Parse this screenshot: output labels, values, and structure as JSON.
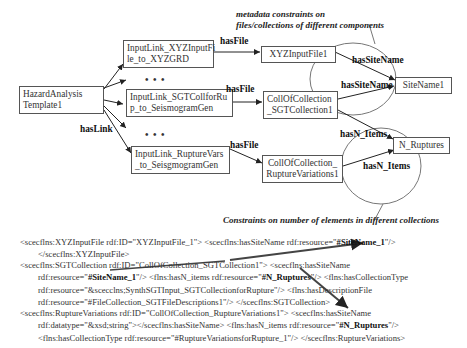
{
  "notes": {
    "metadata_line1": "metadata constraints on",
    "metadata_line2": "files/collections of different components",
    "constraints": "Constraints on number of elements in different collections"
  },
  "nodes": {
    "template": {
      "line1": "HazardAnalysis",
      "line2": "Template1"
    },
    "link_xyz": {
      "line1": "InputLink_XYZInputFi",
      "line2": "le_to_XYZGRD"
    },
    "link_sgt": {
      "line1": "InputLink_SGTCollforRu",
      "line2": "p_to_SeismogramGen"
    },
    "link_rupture": {
      "line1": "InputLink_RuptureVars",
      "line2": "_to_SeisgmogramGen"
    },
    "xyz_file": {
      "line1": "XYZInputFile1"
    },
    "sgt_coll": {
      "line1": "CollOfCollection",
      "line2": "_SGTCollection1"
    },
    "rupture_coll": {
      "line1": "CollOfCollection_",
      "line2": "RuptureVariations1"
    },
    "sitename": {
      "line1": "SiteName1"
    },
    "n_ruptures": {
      "line1": "N_Ruptures"
    }
  },
  "edges": {
    "has_link": "hasLink",
    "has_file_1": "hasFile",
    "has_file_2": "hasFile",
    "has_file_3": "hasFile",
    "has_sitename_1": "hasSiteName",
    "has_sitename_2": "hasSiteName",
    "has_n_items_1": "hasN_Items",
    "has_n_items_2": "hasN_Items",
    "ellipsis": "• • •"
  },
  "code": {
    "block1": {
      "l1_a": "<scecflns:XYZInputFile rdf:ID=\"XYZInputFile_1\"> <scecflns:hasSiteName rdf:resource=\"",
      "l1_b": "#SiteName_1",
      "l1_c": "\"/>",
      "l2": "</scecflns:XYZInputFile>"
    },
    "block2": {
      "l1": "<scecflns:SGTCollection rdf:ID=\"CollOfCollection_SGTCollection1\"> <scecflns:hasSiteName",
      "l2_a": "rdf:resource=\"",
      "l2_b": "#SiteName_1",
      "l2_c": "\"/> <flns:hasN_items rdf:resource=\"",
      "l2_d": "#N_Ruptures",
      "l2_e": "\"/> <flns:hasCollectionType",
      "l3": "rdf:resource=\"&scecclns;SynthSGTInput_SGTCollectionforRupture\"/> <flns:hasDescriptionFile",
      "l4": "rdf:resource=\"#FileCollection_SGTFileDescriptions1\"/> </scecflns:SGTCollection>"
    },
    "block3": {
      "l1": "<scecflns:RuptureVariations rdf:ID=\"CollOfCollection_RuptureVariations1\"> <scecflns:hasSiteName",
      "l2_a": "rdf:datatype=\"&xsd;string\"></scecflns:hasSiteName> <flns:hasN_items rdf:resource=\"",
      "l2_b": "#N_Ruptures",
      "l2_c": "\"/>",
      "l3": "<flns:hasCollectionType rdf:resource=\"#RuptureVariationsforRupture_1\"/> </scecflns:RuptureVariations>"
    }
  },
  "colors": {
    "line": "#333333",
    "ellipse": "#777777",
    "box_border": "#555555"
  }
}
